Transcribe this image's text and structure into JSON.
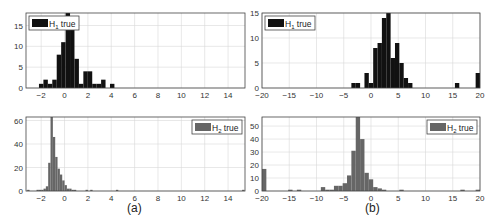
{
  "chart_data": [
    {
      "id": "a-top",
      "type": "bar",
      "panel": "(a)",
      "legend": "H1 true",
      "legend_main": "H",
      "legend_sub": "1",
      "legend_rest": " true",
      "legend_position": "top-left",
      "color": "#111111",
      "xlim": [
        -3.3,
        15.45
      ],
      "ylim": [
        0,
        18
      ],
      "xticks": [
        -2,
        0,
        2,
        4,
        6,
        8,
        10,
        12,
        14
      ],
      "yticks": [
        0,
        5,
        10,
        15
      ],
      "bin_width": 0.38,
      "x": [
        -2.0,
        -1.62,
        -1.24,
        -0.86,
        -0.48,
        -0.1,
        0.28,
        0.66,
        1.04,
        1.42,
        1.8,
        2.18,
        2.56,
        2.94,
        3.32,
        3.7,
        4.08
      ],
      "values": [
        1,
        2,
        1,
        2,
        8,
        11,
        18,
        14,
        7,
        1,
        4,
        4,
        1,
        1,
        2,
        0,
        1
      ],
      "grid": true
    },
    {
      "id": "a-bottom",
      "type": "bar",
      "panel": "(a)",
      "legend": "H2 true",
      "legend_main": "H",
      "legend_sub": "2",
      "legend_rest": " true",
      "legend_position": "top-right",
      "color": "#666666",
      "xlim": [
        -3.3,
        15.45
      ],
      "ylim": [
        0,
        63
      ],
      "xticks": [
        -2,
        0,
        2,
        4,
        6,
        8,
        10,
        12,
        14
      ],
      "yticks": [
        0,
        20,
        40,
        60
      ],
      "bin_width": 0.2,
      "x": [
        -3.1,
        -2.9,
        -2.7,
        -2.5,
        -2.3,
        -2.1,
        -1.9,
        -1.7,
        -1.5,
        -1.3,
        -1.1,
        -0.9,
        -0.7,
        -0.5,
        -0.3,
        -0.1,
        0.1,
        0.3,
        0.5,
        0.7,
        0.9,
        1.1,
        1.3,
        1.9,
        2.3,
        4.5,
        15.3
      ],
      "values": [
        1,
        0,
        0,
        0,
        1,
        1,
        1,
        2,
        4,
        24,
        63,
        46,
        29,
        19,
        14,
        9,
        5,
        2,
        2,
        1,
        1,
        0,
        0,
        1,
        1,
        1,
        1
      ],
      "grid": true
    },
    {
      "id": "b-top",
      "type": "bar",
      "panel": "(b)",
      "legend": "H1 true",
      "legend_main": "H",
      "legend_sub": "1",
      "legend_rest": " true",
      "legend_position": "top-left",
      "color": "#111111",
      "xlim": [
        -20,
        20
      ],
      "ylim": [
        0,
        15
      ],
      "xticks": [
        -20,
        -15,
        -10,
        -5,
        0,
        5,
        10,
        15,
        20
      ],
      "yticks": [
        0,
        5,
        10,
        15
      ],
      "bin_width": 0.8,
      "x": [
        -3.2,
        -2.4,
        -1.6,
        -0.8,
        0.0,
        0.8,
        1.6,
        2.4,
        3.2,
        4.0,
        4.8,
        5.6,
        6.4,
        7.2,
        15.8,
        19.6
      ],
      "values": [
        1,
        1,
        0,
        3,
        1,
        8,
        9,
        14,
        15,
        6,
        9,
        5,
        2,
        1,
        1,
        3
      ],
      "grid": true
    },
    {
      "id": "b-bottom",
      "type": "bar",
      "panel": "(b)",
      "legend": "H2 true",
      "legend_main": "H",
      "legend_sub": "2",
      "legend_rest": " true",
      "legend_position": "top-right",
      "color": "#666666",
      "xlim": [
        -20,
        20
      ],
      "ylim": [
        0,
        57
      ],
      "xticks": [
        -20,
        -15,
        -10,
        -5,
        0,
        5,
        10,
        15,
        20
      ],
      "yticks": [
        0,
        10,
        20,
        30,
        40,
        50
      ],
      "bin_width": 0.8,
      "x": [
        -19.6,
        -14.8,
        -13.2,
        -8.8,
        -8.0,
        -7.2,
        -6.4,
        -5.6,
        -4.8,
        -4.0,
        -3.2,
        -2.4,
        -1.6,
        -0.8,
        0.0,
        0.8,
        1.6,
        2.4,
        5.6,
        16.8,
        19.6
      ],
      "values": [
        17,
        1,
        1,
        3,
        1,
        1,
        4,
        4,
        6,
        12,
        31,
        57,
        40,
        14,
        9,
        3,
        2,
        1,
        1,
        1,
        1
      ],
      "grid": true
    }
  ],
  "captions": {
    "a": "(a)",
    "b": "(b)"
  }
}
